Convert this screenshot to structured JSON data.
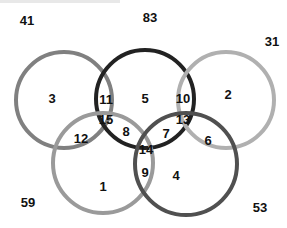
{
  "diagram": {
    "type": "venn",
    "sets": [
      {
        "id": "A",
        "name": "top-left",
        "cx": 64,
        "cy": 100,
        "r": 48,
        "stroke": "#808080"
      },
      {
        "id": "B",
        "name": "top-center",
        "cx": 145,
        "cy": 99,
        "r": 49,
        "stroke": "#222222"
      },
      {
        "id": "C",
        "name": "top-right",
        "cx": 226,
        "cy": 100,
        "r": 48,
        "stroke": "#b0b0b0"
      },
      {
        "id": "D",
        "name": "bottom-left",
        "cx": 103,
        "cy": 163,
        "r": 50,
        "stroke": "#9a9a9a"
      },
      {
        "id": "E",
        "name": "bottom-right",
        "cx": 186,
        "cy": 164,
        "r": 51,
        "stroke": "#505050"
      }
    ],
    "stroke_width": 4,
    "labels": [
      {
        "text": "41",
        "x": 27,
        "y": 20,
        "region": "outside"
      },
      {
        "text": "83",
        "x": 150,
        "y": 17,
        "region": "outside"
      },
      {
        "text": "31",
        "x": 272,
        "y": 41,
        "region": "outside"
      },
      {
        "text": "3",
        "x": 52,
        "y": 98,
        "region": "A"
      },
      {
        "text": "11",
        "x": 106,
        "y": 99,
        "region": "A∩B"
      },
      {
        "text": "5",
        "x": 145,
        "y": 98,
        "region": "B"
      },
      {
        "text": "10",
        "x": 183,
        "y": 98,
        "region": "B∩C"
      },
      {
        "text": "2",
        "x": 228,
        "y": 94,
        "region": "C"
      },
      {
        "text": "15",
        "x": 106,
        "y": 119,
        "region": "A∩B∩D"
      },
      {
        "text": "12",
        "x": 81,
        "y": 138,
        "region": "A∩D"
      },
      {
        "text": "8",
        "x": 126,
        "y": 131,
        "region": "B∩D"
      },
      {
        "text": "7",
        "x": 166,
        "y": 133,
        "region": "B∩E"
      },
      {
        "text": "13",
        "x": 183,
        "y": 119,
        "region": "B∩C∩E"
      },
      {
        "text": "6",
        "x": 208,
        "y": 140,
        "region": "C∩E"
      },
      {
        "text": "14",
        "x": 146,
        "y": 149,
        "region": "B∩D∩E"
      },
      {
        "text": "9",
        "x": 145,
        "y": 172,
        "region": "D∩E"
      },
      {
        "text": "1",
        "x": 103,
        "y": 186,
        "region": "D"
      },
      {
        "text": "4",
        "x": 176,
        "y": 175,
        "region": "E"
      },
      {
        "text": "59",
        "x": 28,
        "y": 202,
        "region": "outside"
      },
      {
        "text": "53",
        "x": 260,
        "y": 207,
        "region": "outside"
      }
    ]
  }
}
